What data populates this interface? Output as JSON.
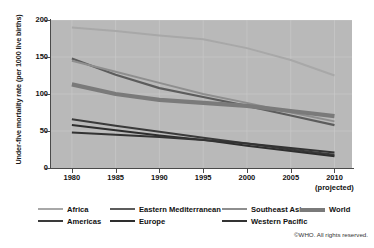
{
  "chart_data": {
    "type": "line",
    "title": "",
    "xlabel": "",
    "ylabel": "Under-five mortality rate (per 1000 live births)",
    "x": [
      1980,
      1985,
      1990,
      1995,
      2000,
      2005,
      2010
    ],
    "xtick_labels": [
      "1980",
      "1985",
      "1990",
      "1995",
      "2000",
      "2005",
      "2010"
    ],
    "xtick_sublabel_last": "(projected)",
    "xlim": [
      1977.5,
      2012
    ],
    "ylim": [
      0,
      200
    ],
    "ytick_labels": [
      "0",
      "50",
      "100",
      "150",
      "200"
    ],
    "ytick_values": [
      0,
      50,
      100,
      150,
      200
    ],
    "grid": true,
    "legend_position": "bottom",
    "plot_background": "#b9b9b9",
    "series": [
      {
        "name": "Africa",
        "color": "#a8a8a8",
        "width": 2.0,
        "values": [
          190,
          185,
          179,
          174,
          162,
          146,
          125
        ]
      },
      {
        "name": "Eastern Mediterranean",
        "color": "#5c5c5c",
        "width": 2.2,
        "values": [
          148,
          126,
          108,
          96,
          84,
          71,
          58
        ]
      },
      {
        "name": "Southeast Asia",
        "color": "#8e8e8e",
        "width": 2.0,
        "values": [
          145,
          130,
          115,
          100,
          88,
          75,
          63
        ]
      },
      {
        "name": "World",
        "color": "#7a7a7a",
        "width": 4.2,
        "values": [
          113,
          100,
          92,
          88,
          84,
          77,
          70
        ]
      },
      {
        "name": "Americas",
        "color": "#3a3a3a",
        "width": 2.0,
        "values": [
          66,
          57,
          49,
          41,
          33,
          25,
          18
        ]
      },
      {
        "name": "Europe",
        "color": "#2e2e2e",
        "width": 2.0,
        "values": [
          58,
          51,
          44,
          38,
          30,
          23,
          16
        ]
      },
      {
        "name": "Western Pacific",
        "color": "#333333",
        "width": 2.0,
        "values": [
          48,
          45,
          42,
          38,
          33,
          27,
          21
        ]
      }
    ]
  },
  "legend": {
    "rows": [
      [
        {
          "label": "Africa",
          "series": "Africa"
        },
        {
          "label": "Eastern Mediterranean",
          "series": "Eastern Mediterranean"
        },
        {
          "label": "Southeast Asia",
          "series": "Southeast Asia"
        },
        {
          "label": "World",
          "series": "World"
        }
      ],
      [
        {
          "label": "Americas",
          "series": "Americas"
        },
        {
          "label": "Europe",
          "series": "Europe"
        },
        {
          "label": "Western Pacific",
          "series": "Western Pacific"
        }
      ]
    ]
  },
  "footer": {
    "copyright": "©WHO. All rights reserved."
  }
}
